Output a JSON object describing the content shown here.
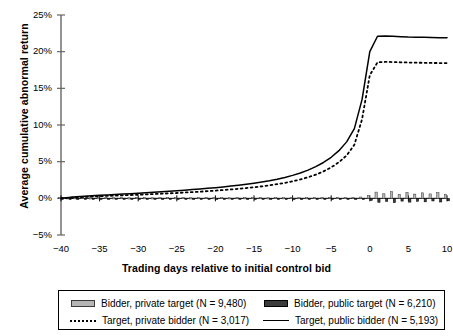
{
  "chart_data": {
    "type": "line",
    "title": "",
    "xlabel": "Trading days relative to initial control bid",
    "ylabel": "Average cumulative abnormal return",
    "xlim": [
      -40,
      10
    ],
    "ylim": [
      -0.05,
      0.25
    ],
    "xticks": [
      "-40",
      "-35",
      "-30",
      "-25",
      "-20",
      "-15",
      "-10",
      "-5",
      "0",
      "5",
      "10"
    ],
    "xtick_values": [
      -40,
      -35,
      -30,
      -25,
      -20,
      -15,
      -10,
      -5,
      0,
      5,
      10
    ],
    "yticks": [
      "-5%",
      "0%",
      "5%",
      "10%",
      "15%",
      "20%",
      "25%"
    ],
    "ytick_values": [
      -0.05,
      0,
      0.05,
      0.1,
      0.15,
      0.2,
      0.25
    ],
    "grid": false,
    "legend_position": "bottom",
    "x": [
      -40,
      -39,
      -38,
      -37,
      -36,
      -35,
      -34,
      -33,
      -32,
      -31,
      -30,
      -29,
      -28,
      -27,
      -26,
      -25,
      -24,
      -23,
      -22,
      -21,
      -20,
      -19,
      -18,
      -17,
      -16,
      -15,
      -14,
      -13,
      -12,
      -11,
      -10,
      -9,
      -8,
      -7,
      -6,
      -5,
      -4,
      -3,
      -2,
      -1,
      0,
      1,
      2,
      3,
      4,
      5,
      6,
      7,
      8,
      9,
      10
    ],
    "series": [
      {
        "name": "Target, public bidder (N = 5,193)",
        "style": "solid",
        "color": "#000000",
        "values": [
          0.0,
          0.0012,
          0.0021,
          0.0028,
          0.0035,
          0.0041,
          0.0047,
          0.0053,
          0.0058,
          0.0064,
          0.007,
          0.0076,
          0.0082,
          0.0089,
          0.0096,
          0.0103,
          0.0111,
          0.0119,
          0.0127,
          0.0136,
          0.0146,
          0.0156,
          0.0167,
          0.0179,
          0.0192,
          0.0206,
          0.0222,
          0.024,
          0.0261,
          0.0285,
          0.0313,
          0.0346,
          0.0385,
          0.0432,
          0.0489,
          0.056,
          0.065,
          0.077,
          0.095,
          0.135,
          0.2,
          0.221,
          0.2215,
          0.221,
          0.2205,
          0.22,
          0.2198,
          0.2195,
          0.2192,
          0.219,
          0.219
        ]
      },
      {
        "name": "Target, private bidder (N = 3,017)",
        "style": "dotted",
        "color": "#000000",
        "values": [
          0.0,
          0.0008,
          0.0014,
          0.0019,
          0.0024,
          0.0029,
          0.0033,
          0.0037,
          0.0041,
          0.0045,
          0.0049,
          0.0054,
          0.0058,
          0.0063,
          0.0068,
          0.0073,
          0.0079,
          0.0085,
          0.0091,
          0.0098,
          0.0105,
          0.0113,
          0.0121,
          0.013,
          0.014,
          0.0151,
          0.0163,
          0.0177,
          0.0193,
          0.0211,
          0.0232,
          0.0257,
          0.0287,
          0.0323,
          0.0367,
          0.0422,
          0.0492,
          0.0585,
          0.073,
          0.108,
          0.168,
          0.1855,
          0.1862,
          0.1858,
          0.1855,
          0.1852,
          0.185,
          0.1848,
          0.1846,
          0.1845,
          0.1845
        ]
      }
    ],
    "bar_series": [
      {
        "name": "Bidder, private target (N = 9,480)",
        "color": "#b5b5b5",
        "edge": "#3a3a3a",
        "values": [
          0.001,
          0.0008,
          0.0009,
          0.0011,
          0.0007,
          0.0009,
          0.0012,
          0.0008,
          0.001,
          0.0007,
          0.0011,
          0.0009,
          0.0008,
          0.0012,
          0.001,
          0.0009,
          0.0011,
          0.0008,
          0.001,
          0.0012,
          0.0009,
          0.0011,
          0.0008,
          0.001,
          0.0009,
          0.0012,
          0.001,
          0.0008,
          0.0011,
          0.0009,
          0.0012,
          0.001,
          0.0009,
          0.0011,
          0.001,
          0.0013,
          0.0011,
          0.0012,
          0.0014,
          0.0018,
          0.004,
          0.0085,
          0.0062,
          0.009,
          0.0055,
          0.008,
          0.0058,
          0.0075,
          0.006,
          0.0078,
          0.0052
        ]
      },
      {
        "name": "Bidder, public target (N = 6,210)",
        "color": "#3b3b3b",
        "edge": "#000000",
        "values": [
          -0.0008,
          -0.0006,
          -0.0009,
          -0.0007,
          -0.001,
          -0.0008,
          -0.0006,
          -0.0009,
          -0.0007,
          -0.001,
          -0.0008,
          -0.0011,
          -0.0009,
          -0.0007,
          -0.001,
          -0.0008,
          -0.0011,
          -0.0009,
          -0.0007,
          -0.001,
          -0.0009,
          -0.0008,
          -0.0011,
          -0.0009,
          -0.001,
          -0.0008,
          -0.0011,
          -0.001,
          -0.0009,
          -0.0011,
          -0.0008,
          -0.001,
          -0.0012,
          -0.0009,
          -0.0011,
          -0.001,
          -0.0012,
          -0.0011,
          -0.0013,
          -0.0015,
          -0.003,
          -0.0055,
          -0.0042,
          -0.006,
          -0.0038,
          -0.0052,
          -0.004,
          -0.0048,
          -0.0036,
          -0.005,
          -0.0034
        ]
      }
    ]
  },
  "legend": {
    "items": [
      {
        "label": "Bidder, private target (N = 9,480)",
        "swatch": "bar-light"
      },
      {
        "label": "Bidder, public target (N = 6,210)",
        "swatch": "bar-dark"
      },
      {
        "label": "Target, private bidder (N = 3,017)",
        "swatch": "line-dot"
      },
      {
        "label": "Target, public bidder (N = 5,193)",
        "swatch": "line-solid"
      }
    ]
  }
}
